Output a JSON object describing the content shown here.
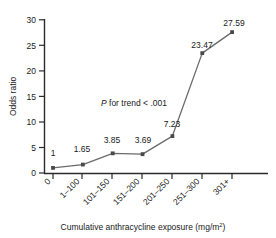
{
  "chart_data": {
    "type": "line",
    "title": "",
    "xlabel": "Cumulative anthracycline exposure (mg/m2)",
    "xlabel_main": "Cumulative anthracycline exposure (mg/m",
    "xlabel_sup": "2",
    "xlabel_tail": ")",
    "ylabel": "Odds ratio",
    "categories": [
      "0",
      "1–100",
      "101–150",
      "151–200",
      "201–250",
      "251–300",
      "301+"
    ],
    "values": [
      1,
      1.65,
      3.85,
      3.69,
      7.23,
      23.47,
      27.59
    ],
    "point_labels": [
      "1",
      "1.65",
      "3.85",
      "3.69",
      "7.23",
      "23.47",
      "27.59"
    ],
    "ylim": [
      0,
      30
    ],
    "yticks": [
      0,
      5,
      10,
      15,
      20,
      25,
      30
    ],
    "ytick_labels": [
      "0",
      "5",
      "10",
      "15",
      "20",
      "25",
      "30"
    ],
    "grid": false,
    "legend": "none",
    "annotation": "P for trend < .001",
    "annotation_italic_prefix": "P",
    "annotation_rest": " for trend < .001",
    "series_color": "#6b6b6b",
    "marker_color": "#4a4a4a",
    "axis_color": "#2b2b2b",
    "xtick_rotation": -45
  }
}
